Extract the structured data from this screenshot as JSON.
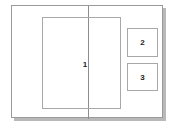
{
  "diagram": {
    "type": "page-layout-wireframe",
    "background_color": "#ffffff",
    "frame": {
      "name": "page-frame",
      "stroke_color": "#9a9a9a",
      "fill_color": "#ffffff",
      "shadow_color": "#b9b9b9"
    },
    "fold_line": {
      "name": "fold-line",
      "color": "#8d8d8d",
      "orientation": "vertical"
    },
    "regions": [
      {
        "id": "1",
        "label": "1",
        "name": "region-main",
        "stroke_color": "#a8a8a8",
        "description": "large central content block"
      },
      {
        "id": "2",
        "label": "2",
        "name": "region-aside-top",
        "stroke_color": "#a8a8a8",
        "description": "upper right small block"
      },
      {
        "id": "3",
        "label": "3",
        "name": "region-aside-bottom",
        "stroke_color": "#a8a8a8",
        "description": "lower right small block"
      }
    ]
  }
}
